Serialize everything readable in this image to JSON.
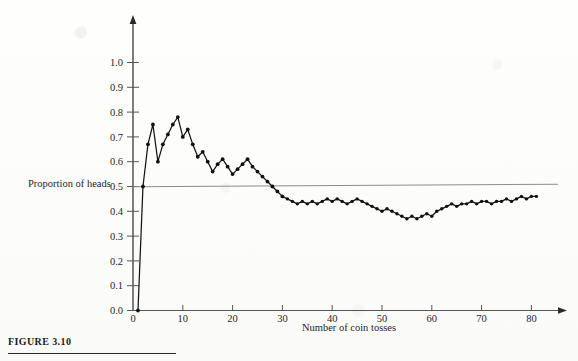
{
  "figure": {
    "caption": "FIGURE 3.10",
    "y_axis_title": "Proportion of heads",
    "reference_line_label": "0.5"
  },
  "chart_data": {
    "type": "line",
    "title": "",
    "xlabel": "Number of coin tosses",
    "ylabel": "Proportion of heads",
    "xlim": [
      0,
      85
    ],
    "ylim": [
      0.0,
      1.05
    ],
    "grid": false,
    "legend": "none",
    "xticks": [
      0,
      10,
      20,
      30,
      40,
      50,
      60,
      70,
      80
    ],
    "xtick_labels": [
      "0",
      "10",
      "20",
      "30",
      "40",
      "50",
      "60",
      "70",
      "80"
    ],
    "yticks": [
      0.0,
      0.1,
      0.2,
      0.3,
      0.4,
      0.5,
      0.6,
      0.7,
      0.8,
      0.9,
      1.0
    ],
    "ytick_labels": [
      "0.0",
      "0.1",
      "0.2",
      "0.3",
      "0.4",
      "0.5",
      "0.6",
      "0.7",
      "0.8",
      "0.9",
      "1.0"
    ],
    "reference_line": {
      "orientation": "horizontal",
      "value": 0.5,
      "label": "0.5",
      "x_start": 0,
      "x_end": 85
    },
    "markers": "filled-circle",
    "series": [
      {
        "name": "Proportion of heads",
        "x": [
          1,
          2,
          3,
          4,
          5,
          6,
          7,
          8,
          9,
          10,
          11,
          12,
          13,
          14,
          15,
          16,
          17,
          18,
          19,
          20,
          21,
          22,
          23,
          24,
          25,
          26,
          27,
          28,
          29,
          30,
          31,
          32,
          33,
          34,
          35,
          36,
          37,
          38,
          39,
          40,
          41,
          42,
          43,
          44,
          45,
          46,
          47,
          48,
          49,
          50,
          51,
          52,
          53,
          54,
          55,
          56,
          57,
          58,
          59,
          60,
          61,
          62,
          63,
          64,
          65,
          66,
          67,
          68,
          69,
          70,
          71,
          72,
          73,
          74,
          75,
          76,
          77,
          78,
          79,
          80,
          81
        ],
        "values": [
          0.0,
          0.5,
          0.67,
          0.75,
          0.6,
          0.67,
          0.71,
          0.75,
          0.78,
          0.7,
          0.73,
          0.67,
          0.62,
          0.64,
          0.6,
          0.56,
          0.59,
          0.61,
          0.58,
          0.55,
          0.57,
          0.59,
          0.61,
          0.58,
          0.56,
          0.54,
          0.52,
          0.5,
          0.48,
          0.46,
          0.45,
          0.44,
          0.43,
          0.44,
          0.43,
          0.44,
          0.43,
          0.44,
          0.45,
          0.44,
          0.45,
          0.44,
          0.43,
          0.44,
          0.45,
          0.44,
          0.43,
          0.42,
          0.41,
          0.4,
          0.41,
          0.4,
          0.39,
          0.38,
          0.37,
          0.38,
          0.37,
          0.38,
          0.39,
          0.38,
          0.4,
          0.41,
          0.42,
          0.43,
          0.42,
          0.43,
          0.43,
          0.44,
          0.43,
          0.44,
          0.44,
          0.43,
          0.44,
          0.44,
          0.45,
          0.44,
          0.45,
          0.46,
          0.45,
          0.46,
          0.46
        ]
      }
    ]
  }
}
